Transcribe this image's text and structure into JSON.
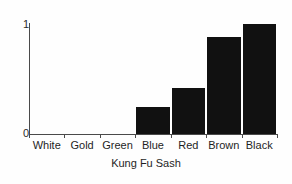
{
  "chart_data": {
    "type": "bar",
    "title": "",
    "subtitle": "",
    "xlabel": "Kung Fu Sash",
    "ylabel": "",
    "categories": [
      "White",
      "Gold",
      "Green",
      "Blue",
      "Red",
      "Brown",
      "Black"
    ],
    "values": [
      0,
      0,
      0,
      0.25,
      0.42,
      0.88,
      1.0
    ],
    "series": [
      {
        "name": "Proportion",
        "values": [
          0,
          0,
          0,
          0.25,
          0.42,
          0.88,
          1.0
        ]
      }
    ],
    "ylim": [
      0,
      1
    ],
    "xlim": [
      0,
      7
    ],
    "y_ticks": [
      "0",
      "1"
    ],
    "y_tick_values": [
      0,
      1
    ],
    "grid": false,
    "legend": "none",
    "bar_color": "#111111",
    "axis_color": "#4a4a4a",
    "background_color": "#ffffff",
    "text_color": "#1f1f1f"
  },
  "axis": {
    "y_top_label": "1",
    "y_bottom_label": "0",
    "x_title": "Kung Fu Sash"
  }
}
